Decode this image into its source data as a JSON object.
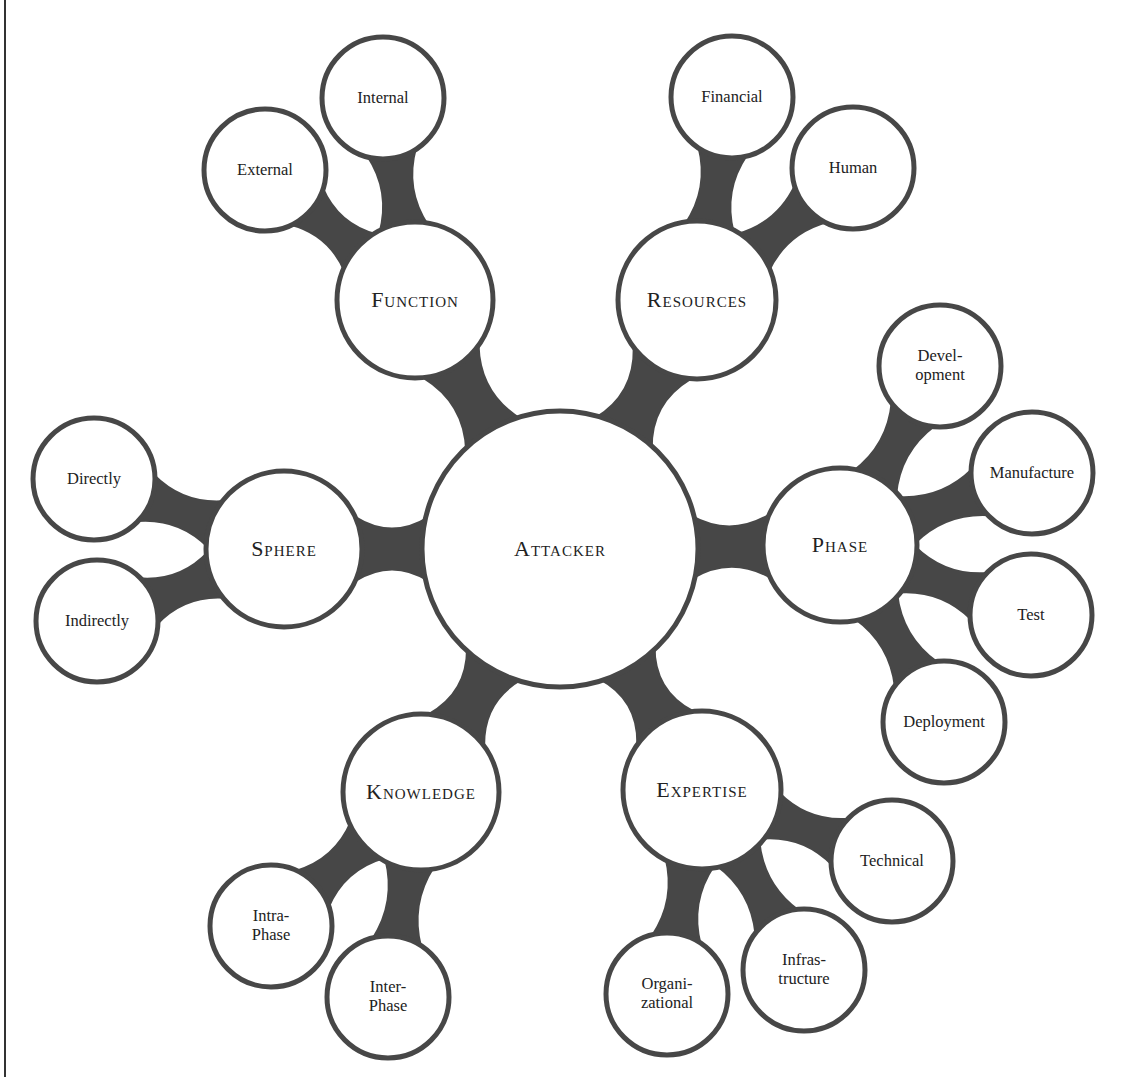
{
  "diagram": {
    "type": "bubble-mind-map",
    "colors": {
      "stroke": "#474747",
      "connector": "#474747",
      "fill": "#ffffff",
      "text": "#222222"
    },
    "root": {
      "id": "attacker",
      "label": "Attacker",
      "cx": 560,
      "cy": 549,
      "r": 138
    },
    "categories": [
      {
        "id": "function",
        "label": "Function",
        "cx": 415,
        "cy": 300,
        "r": 78,
        "children": [
          {
            "id": "external",
            "label": "External",
            "cx": 265,
            "cy": 170,
            "r": 61
          },
          {
            "id": "internal",
            "label": "Internal",
            "cx": 383,
            "cy": 98,
            "r": 61
          }
        ]
      },
      {
        "id": "resources",
        "label": "Resources",
        "cx": 697,
        "cy": 300,
        "r": 79,
        "children": [
          {
            "id": "financial",
            "label": "Financial",
            "cx": 732,
            "cy": 97,
            "r": 61
          },
          {
            "id": "human",
            "label": "Human",
            "cx": 853,
            "cy": 168,
            "r": 61
          }
        ]
      },
      {
        "id": "phase",
        "label": "Phase",
        "cx": 840,
        "cy": 545,
        "r": 77,
        "children": [
          {
            "id": "development",
            "label": "Devel-\nopment",
            "cx": 940,
            "cy": 366,
            "r": 61
          },
          {
            "id": "manufacture",
            "label": "Manufacture",
            "cx": 1032,
            "cy": 473,
            "r": 61
          },
          {
            "id": "test",
            "label": "Test",
            "cx": 1031,
            "cy": 615,
            "r": 61
          },
          {
            "id": "deployment",
            "label": "Deployment",
            "cx": 944,
            "cy": 722,
            "r": 61
          }
        ]
      },
      {
        "id": "expertise",
        "label": "Expertise",
        "cx": 702,
        "cy": 790,
        "r": 79,
        "children": [
          {
            "id": "technical",
            "label": "Technical",
            "cx": 892,
            "cy": 861,
            "r": 61
          },
          {
            "id": "infrastructure",
            "label": "Infras-\ntructure",
            "cx": 804,
            "cy": 970,
            "r": 61
          },
          {
            "id": "organizational",
            "label": "Organi-\nzational",
            "cx": 667,
            "cy": 994,
            "r": 61
          }
        ]
      },
      {
        "id": "knowledge",
        "label": "Knowledge",
        "cx": 421,
        "cy": 792,
        "r": 78,
        "children": [
          {
            "id": "intra-phase",
            "label": "Intra-\nPhase",
            "cx": 271,
            "cy": 926,
            "r": 61
          },
          {
            "id": "inter-phase",
            "label": "Inter-\nPhase",
            "cx": 388,
            "cy": 997,
            "r": 61
          }
        ]
      },
      {
        "id": "sphere",
        "label": "Sphere",
        "cx": 284,
        "cy": 549,
        "r": 78,
        "children": [
          {
            "id": "directly",
            "label": "Directly",
            "cx": 94,
            "cy": 479,
            "r": 61
          },
          {
            "id": "indirectly",
            "label": "Indirectly",
            "cx": 97,
            "cy": 621,
            "r": 61
          }
        ]
      }
    ]
  }
}
